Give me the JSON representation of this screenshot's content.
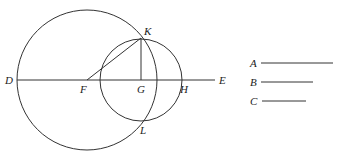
{
  "diagram": {
    "type": "geometric construction",
    "points": {
      "D": {
        "label": "D",
        "x": 17,
        "y": 80
      },
      "E": {
        "label": "E",
        "x": 215,
        "y": 80
      },
      "F": {
        "label": "F",
        "x": 87,
        "y": 80
      },
      "G": {
        "label": "G",
        "x": 141,
        "y": 80
      },
      "H": {
        "label": "H",
        "x": 181,
        "y": 80
      },
      "K": {
        "label": "K",
        "x": 141,
        "y": 38
      },
      "L": {
        "label": "L",
        "x": 141,
        "y": 122
      }
    },
    "circles": [
      {
        "name": "large-circle",
        "center": "F",
        "radius": 70
      },
      {
        "name": "small-circle",
        "center": "G",
        "radius": 41
      }
    ],
    "segments": [
      {
        "name": "line-DE",
        "from": "D",
        "to": "E"
      },
      {
        "name": "segment-FK",
        "from": "F",
        "to": "K"
      },
      {
        "name": "segment-KG",
        "from": "K",
        "to": "G"
      }
    ],
    "given_lengths": [
      {
        "label": "A",
        "length": 72
      },
      {
        "label": "B",
        "length": 52
      },
      {
        "label": "C",
        "length": 44
      }
    ]
  }
}
